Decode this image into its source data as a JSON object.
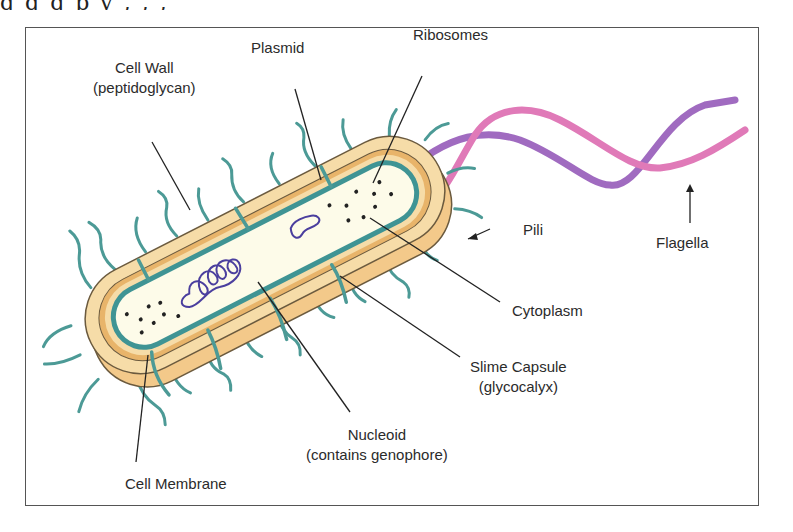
{
  "page": {
    "top_text_fragment": "g  g  g  p  y  ,  ,  ,"
  },
  "diagram": {
    "labels": {
      "cell_wall": {
        "line1": "Cell Wall",
        "line2": "(peptidoglycan)"
      },
      "plasmid": {
        "line1": "Plasmid"
      },
      "ribosomes": {
        "line1": "Ribosomes"
      },
      "pili": {
        "line1": "Pili"
      },
      "flagella": {
        "line1": "Flagella"
      },
      "cytoplasm": {
        "line1": "Cytoplasm"
      },
      "slime_capsule": {
        "line1": "Slime Capsule",
        "line2": "(glycocalyx)"
      },
      "nucleoid": {
        "line1": "Nucleoid",
        "line2": "(contains genophore)"
      },
      "cell_membrane": {
        "line1": "Cell Membrane"
      }
    },
    "colors": {
      "capsule": "#f3c98a",
      "capsule_outline": "#6b5a3e",
      "cell_wall": "#f6dca8",
      "wall_band": "#e8b46a",
      "membrane": "#3f9494",
      "cytoplasm": "#fdfbe9",
      "pili": "#4c9a96",
      "flagella_pink": "#e07ab8",
      "flagella_purple": "#a06bc0",
      "dna": "#4b3f9e",
      "ribosome": "#222222",
      "leader_line": "#222222",
      "text": "#2b2b2b",
      "frame": "#555555"
    }
  }
}
